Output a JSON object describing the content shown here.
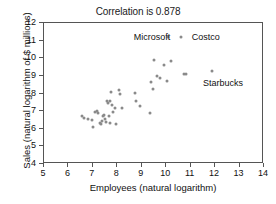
{
  "chart_data": {
    "type": "scatter",
    "title": "Correlation is 0.878",
    "xlabel": "Employees (natural logarithm)",
    "ylabel": "Sales (natural logarithm of $ millions)",
    "xlim": [
      5,
      14
    ],
    "ylim": [
      4,
      12
    ],
    "xticks": [
      5,
      6,
      7,
      8,
      9,
      10,
      11,
      12,
      13,
      14
    ],
    "yticks": [
      4,
      5,
      6,
      7,
      8,
      9,
      10,
      11,
      12
    ],
    "grid": false,
    "legend": "none",
    "correlation": 0.878,
    "point_color": "#8a8a8a",
    "points": [
      {
        "x": 6.55,
        "y": 6.7
      },
      {
        "x": 6.62,
        "y": 6.62
      },
      {
        "x": 6.78,
        "y": 6.55
      },
      {
        "x": 6.98,
        "y": 6.5
      },
      {
        "x": 7.02,
        "y": 6.08
      },
      {
        "x": 7.08,
        "y": 6.95
      },
      {
        "x": 7.18,
        "y": 7.0
      },
      {
        "x": 7.22,
        "y": 6.92
      },
      {
        "x": 7.3,
        "y": 6.35
      },
      {
        "x": 7.34,
        "y": 6.28
      },
      {
        "x": 7.38,
        "y": 6.45
      },
      {
        "x": 7.42,
        "y": 6.7
      },
      {
        "x": 7.46,
        "y": 6.8
      },
      {
        "x": 7.5,
        "y": 6.58
      },
      {
        "x": 7.54,
        "y": 6.4
      },
      {
        "x": 7.58,
        "y": 7.55
      },
      {
        "x": 7.62,
        "y": 7.45
      },
      {
        "x": 7.64,
        "y": 6.72
      },
      {
        "x": 7.68,
        "y": 6.3
      },
      {
        "x": 7.72,
        "y": 7.6
      },
      {
        "x": 7.76,
        "y": 8.1
      },
      {
        "x": 7.8,
        "y": 7.32
      },
      {
        "x": 7.84,
        "y": 6.95
      },
      {
        "x": 7.9,
        "y": 7.18
      },
      {
        "x": 7.96,
        "y": 6.28
      },
      {
        "x": 8.05,
        "y": 8.18
      },
      {
        "x": 8.12,
        "y": 7.95
      },
      {
        "x": 8.18,
        "y": 7.18
      },
      {
        "x": 8.72,
        "y": 8.02
      },
      {
        "x": 8.78,
        "y": 7.58
      },
      {
        "x": 8.92,
        "y": 7.3
      },
      {
        "x": 9.32,
        "y": 6.92
      },
      {
        "x": 9.38,
        "y": 8.65
      },
      {
        "x": 9.46,
        "y": 8.25
      },
      {
        "x": 9.52,
        "y": 9.88
      },
      {
        "x": 9.62,
        "y": 9.02
      },
      {
        "x": 9.76,
        "y": 8.9
      },
      {
        "x": 9.92,
        "y": 9.62
      },
      {
        "x": 10.02,
        "y": 8.7
      },
      {
        "x": 10.18,
        "y": 9.85
      },
      {
        "x": 10.72,
        "y": 9.08
      },
      {
        "x": 10.82,
        "y": 9.1
      },
      {
        "x": 11.86,
        "y": 9.3
      },
      {
        "x": 10.08,
        "y": 11.18
      },
      {
        "x": 10.62,
        "y": 11.18
      }
    ],
    "annotations": [
      {
        "label": "Microsoft",
        "x": 9.42,
        "y": 11.18
      },
      {
        "label": "Costco",
        "x": 11.62,
        "y": 11.18
      },
      {
        "label": "Starbucks",
        "x": 12.32,
        "y": 8.62
      }
    ]
  }
}
